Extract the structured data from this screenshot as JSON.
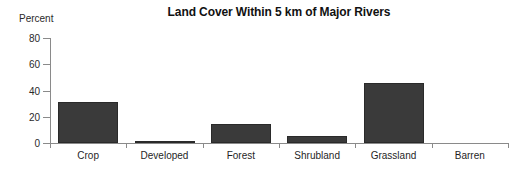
{
  "chart_data": {
    "type": "bar",
    "title": "Land Cover Within 5 km of Major Rivers",
    "xlabel": "",
    "ylabel": "Percent",
    "categories": [
      "Crop",
      "Developed",
      "Forest",
      "Shrubland",
      "Grassland",
      "Barren"
    ],
    "values": [
      31,
      1,
      14.5,
      5,
      46,
      0
    ],
    "ylim": [
      0,
      80
    ],
    "yticks": [
      0,
      20,
      40,
      60,
      80
    ],
    "ytick_labels": [
      "0",
      "20",
      "40",
      "60",
      "80"
    ],
    "grid": false,
    "legend": false,
    "bar_color": "#3a3a3a",
    "bar_edge_color": "#2a2a2a",
    "axis_color": "#8a8a8a",
    "background_color": "#ffffff"
  }
}
